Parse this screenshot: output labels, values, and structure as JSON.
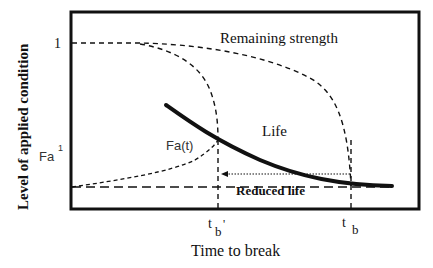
{
  "diagram": {
    "type": "residual-strength-life-diagram",
    "y_axis_label": "Level of applied condition",
    "x_axis_label": "Time to break",
    "y_ticks": {
      "top": "1",
      "fa_base": "Fa",
      "fa_sup": "1"
    },
    "x_ticks": {
      "tb_prime_base": "t",
      "tb_prime_sub": "b",
      "tb_prime_mark": "'",
      "tb_base": "t",
      "tb_sub": "b"
    },
    "curve_labels": {
      "remaining_strength": "Remaining strength",
      "life": "Life",
      "fa_t": "Fa(t)",
      "reduced_life": "Reduced life"
    },
    "colors": {
      "line": "#111111",
      "background": "#ffffff"
    }
  }
}
